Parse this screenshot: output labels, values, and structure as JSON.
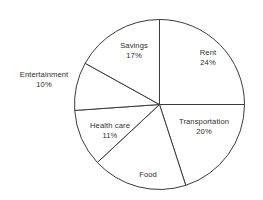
{
  "chart_data": {
    "type": "pie",
    "title": "",
    "subtitle": "",
    "xlabel": "",
    "ylabel": "",
    "legend": "none",
    "grid": false,
    "units": "percent",
    "note": "Food slice has no percentage label shown in the figure",
    "categories": [
      "Rent",
      "Transportation",
      "Food",
      "Health care",
      "Entertainment",
      "Savings"
    ],
    "values": [
      24,
      20,
      18,
      11,
      10,
      17
    ],
    "labels_shown": [
      "24%",
      "20%",
      "",
      "11%",
      "10%",
      "17%"
    ],
    "slices": [
      {
        "name": "Rent",
        "label": "Rent",
        "percent_label": "24%",
        "value": 24,
        "start_angle_deg": 0,
        "end_angle_deg": 90,
        "label_x": 208,
        "label_y": 58,
        "outside": false
      },
      {
        "name": "Transportation",
        "label": "Transportation",
        "percent_label": "20%",
        "value": 20,
        "start_angle_deg": 90,
        "end_angle_deg": 162,
        "label_x": 204,
        "label_y": 127,
        "outside": false
      },
      {
        "name": "Food",
        "label": "Food",
        "percent_label": "",
        "value": 18,
        "start_angle_deg": 162,
        "end_angle_deg": 227,
        "label_x": 148,
        "label_y": 175,
        "outside": false
      },
      {
        "name": "Health care",
        "label": "Health care",
        "percent_label": "11%",
        "value": 11,
        "start_angle_deg": 227,
        "end_angle_deg": 266,
        "label_x": 110,
        "label_y": 131,
        "outside": false
      },
      {
        "name": "Entertainment",
        "label": "Entertainment",
        "percent_label": "10%",
        "value": 10,
        "start_angle_deg": 266,
        "end_angle_deg": 299,
        "label_x": 44,
        "label_y": 80,
        "outside": true
      },
      {
        "name": "Savings",
        "label": "Savings",
        "percent_label": "17%",
        "value": 17,
        "start_angle_deg": 299,
        "end_angle_deg": 360,
        "label_x": 134,
        "label_y": 51,
        "outside": false
      }
    ],
    "geometry": {
      "center_x": 159.5,
      "center_y": 104.5,
      "radius": 85
    },
    "style": {
      "background": "#ffffff",
      "slice_fill": "#ffffff",
      "outline": "#3a3a3a",
      "text": "#2e2e2e"
    }
  }
}
